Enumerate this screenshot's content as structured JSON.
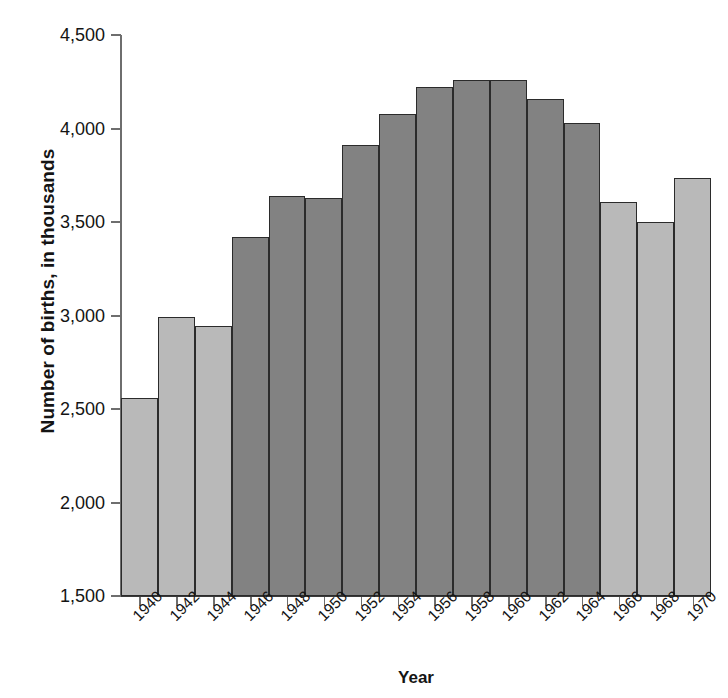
{
  "chart_data": {
    "type": "bar",
    "title": "",
    "xlabel": "Year",
    "ylabel": "Number of births, in thousands",
    "categories": [
      "1940",
      "1942",
      "1944",
      "1946",
      "1948",
      "1950",
      "1952",
      "1954",
      "1956",
      "1958",
      "1960",
      "1962",
      "1964",
      "1966",
      "1968",
      "1970"
    ],
    "values": [
      2560,
      2990,
      2945,
      3420,
      3640,
      3630,
      3910,
      4080,
      4220,
      4260,
      4260,
      4160,
      4030,
      3605,
      3500,
      3735
    ],
    "bar_colors": [
      "#b9b9b9",
      "#b9b9b9",
      "#b9b9b9",
      "#828282",
      "#828282",
      "#828282",
      "#828282",
      "#828282",
      "#828282",
      "#828282",
      "#828282",
      "#828282",
      "#828282",
      "#b9b9b9",
      "#b9b9b9",
      "#b9b9b9"
    ],
    "ylim": [
      1500,
      4500
    ],
    "yticks": [
      1500,
      2000,
      2500,
      3000,
      3500,
      4000,
      4500
    ],
    "ytick_labels": [
      "1,500",
      "2,000",
      "2,500",
      "3,000",
      "3,500",
      "4,000",
      "4,500"
    ],
    "grid": false,
    "legend": "none",
    "colors": {
      "light_bar": "#b9b9b9",
      "dark_bar": "#828282",
      "bar_outline": "#2b2b2b",
      "axis": "#6e6e6e",
      "text": "#141414",
      "background": "#ffffff"
    }
  },
  "axes": {
    "y_title": "Number of births, in thousands",
    "x_title": "Year"
  }
}
